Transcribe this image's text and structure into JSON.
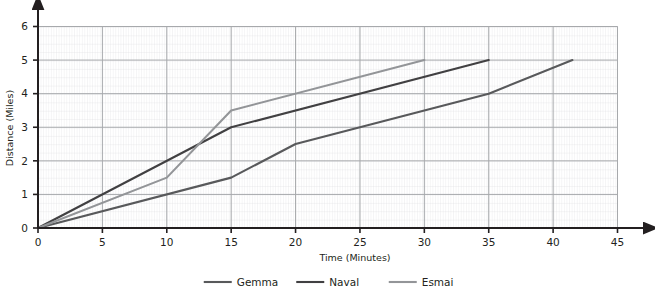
{
  "chart_data": {
    "type": "line",
    "title": "",
    "xlabel": "Time (Minutes)",
    "ylabel": "Distance (Miles)",
    "xlim": [
      0,
      45
    ],
    "ylim": [
      0,
      6
    ],
    "xticks": [
      0,
      5,
      10,
      15,
      20,
      25,
      30,
      35,
      40,
      45
    ],
    "yticks": [
      0,
      1,
      2,
      3,
      4,
      5,
      6
    ],
    "xtick_labels": [
      "0",
      "5",
      "10",
      "15",
      "20",
      "25",
      "30",
      "35",
      "40",
      "45"
    ],
    "ytick_labels": [
      "0",
      "1",
      "2",
      "3",
      "4",
      "5",
      "6"
    ],
    "grid": "graph-paper minor grid every 1 minute and 0.25 miles, major grid at ticks",
    "minor_x_step": 1,
    "minor_y_step": 0.25,
    "legend_position": "below-axes-center",
    "series": [
      {
        "name": "Gemma",
        "color": "#58595b",
        "points": [
          [
            0,
            0
          ],
          [
            15,
            1.5
          ],
          [
            20,
            2.5
          ],
          [
            35,
            4
          ],
          [
            41.5,
            5
          ]
        ]
      },
      {
        "name": "Naval",
        "color": "#414042",
        "points": [
          [
            0,
            0
          ],
          [
            15,
            3
          ],
          [
            35,
            5
          ]
        ]
      },
      {
        "name": "Esmai",
        "color": "#939598",
        "points": [
          [
            0,
            0
          ],
          [
            10,
            1.5
          ],
          [
            15,
            3.5
          ],
          [
            30,
            5
          ]
        ]
      }
    ]
  },
  "axes": {
    "x_axis_label": "Time (Minutes)",
    "y_axis_label": "Distance (Miles)"
  },
  "legend": {
    "entries": [
      {
        "label": "Gemma",
        "color": "#58595b"
      },
      {
        "label": "Naval",
        "color": "#414042"
      },
      {
        "label": "Esmai",
        "color": "#939598"
      }
    ]
  },
  "colors": {
    "background": "#ffffff",
    "axis": "#231f20",
    "text": "#231f20",
    "grid_minor": "#dcdde0",
    "grid_major": "#a7a9ac",
    "gemma": "#58595b",
    "naval": "#414042",
    "esmai": "#939598"
  }
}
